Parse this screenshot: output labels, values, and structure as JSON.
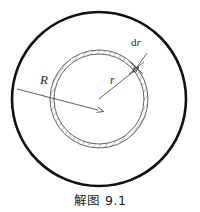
{
  "figure": {
    "caption": "解图 9.1",
    "labels": {
      "outer_radius": "R",
      "inner_radius": "r",
      "thickness_d": "d",
      "thickness_r": "r",
      "thickness_full": "dr"
    },
    "colors": {
      "outer_circle_stroke": "#111111",
      "ring_stroke": "#555555",
      "hatch_stroke": "#777777",
      "leader_line": "#444444",
      "caption_text": "#1a1a1a",
      "background": "#ffffff"
    },
    "geometry": {
      "center_x": 99,
      "center_y": 99,
      "outer_circle_radius": 87,
      "annulus_outer_radius": 49,
      "annulus_inner_radius": 45,
      "outer_circle_stroke_width": 2.6,
      "ring_stroke_width": 0.9
    },
    "annotations": {
      "R_arrow_from_x": 96,
      "R_arrow_from_y": 110,
      "R_arrow_to_x": 15,
      "R_arrow_to_y": 89,
      "r_arrow_from_x": 99,
      "r_arrow_from_y": 99,
      "r_arrow_to_x": 136,
      "r_arrow_to_y": 70,
      "dr_arrow_to_x": 138,
      "dr_arrow_to_y": 68
    }
  }
}
